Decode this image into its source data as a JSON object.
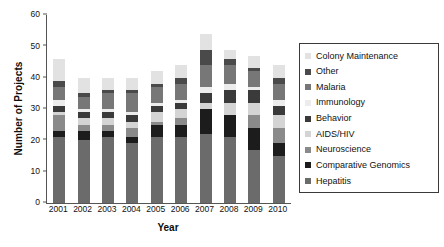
{
  "chart_data": {
    "type": "bar",
    "stacked": true,
    "title": "",
    "xlabel": "Year",
    "ylabel": "Number of Projects",
    "ylim": [
      0,
      60
    ],
    "yticks": [
      0,
      10,
      20,
      30,
      40,
      50,
      60
    ],
    "grid": false,
    "legend_position": "right",
    "categories": [
      "2001",
      "2002",
      "2003",
      "2004",
      "2005",
      "2006",
      "2007",
      "2008",
      "2009",
      "2010"
    ],
    "series": [
      {
        "name": "Hepatitis",
        "color": "#6b6b6b",
        "values": [
          21,
          20,
          21,
          19,
          21,
          21,
          22,
          21,
          17,
          15
        ]
      },
      {
        "name": "Comparative Genomics",
        "color": "#1c1c1c",
        "values": [
          2,
          3,
          2,
          2,
          4,
          4,
          8,
          7,
          7,
          4
        ]
      },
      {
        "name": "Neuroscience",
        "color": "#8a8a8a",
        "values": [
          5,
          2,
          2,
          3,
          1,
          2,
          0,
          0,
          4,
          5
        ]
      },
      {
        "name": "AIDS/HIV",
        "color": "#d4d4d4",
        "values": [
          1,
          2,
          2,
          2,
          3,
          3,
          2,
          4,
          4,
          4
        ]
      },
      {
        "name": "Behavior",
        "color": "#3a3a3a",
        "values": [
          2,
          2,
          2,
          2,
          2,
          2,
          3,
          4,
          4,
          3
        ]
      },
      {
        "name": "Immunology",
        "color": "#ececec",
        "values": [
          2,
          1,
          1,
          1,
          1,
          1,
          2,
          2,
          1,
          2
        ]
      },
      {
        "name": "Malaria",
        "color": "#777777",
        "values": [
          4,
          4,
          5,
          6,
          5,
          5,
          7,
          6,
          5,
          5
        ]
      },
      {
        "name": "Other",
        "color": "#4a4a4a",
        "values": [
          2,
          1,
          1,
          1,
          1,
          2,
          5,
          2,
          1,
          2
        ]
      },
      {
        "name": "Colony Maintenance",
        "color": "#e2e2e2",
        "values": [
          7,
          5,
          4,
          4,
          4,
          4,
          5,
          3,
          4,
          4
        ]
      }
    ],
    "totals": [
      46,
      38,
      39,
      39,
      41,
      43,
      52,
      49,
      46,
      43
    ],
    "legend_order": [
      "Colony Maintenance",
      "Other",
      "Malaria",
      "Immunology",
      "Behavior",
      "AIDS/HIV",
      "Neuroscience",
      "Comparative Genomics",
      "Hepatitis"
    ]
  }
}
